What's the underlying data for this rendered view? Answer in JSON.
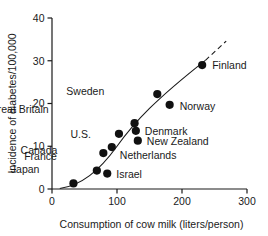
{
  "chart_data": {
    "type": "scatter",
    "title": "",
    "xlabel": "Consumption of cow  milk (liters/person)",
    "ylabel": "Incidence of diabetes/100,000",
    "xlim": [
      0,
      300
    ],
    "ylim": [
      0,
      40
    ],
    "xticks": [
      "0",
      "100",
      "200",
      "300"
    ],
    "xtick_values": [
      0,
      100,
      200,
      300
    ],
    "yticks": [
      "0",
      "10",
      "20",
      "30",
      "40"
    ],
    "ytick_values": [
      0,
      10,
      20,
      30,
      40
    ],
    "grid": false,
    "legend": "none",
    "annotations": [
      "Fitted trend curve rising through the points, extended with a dashed segment beyond Finland"
    ],
    "points": [
      {
        "label": "Japan",
        "x": 33,
        "y": 1.3,
        "label_dx": -34,
        "label_dy": -10
      },
      {
        "label": "France",
        "x": 69,
        "y": 4.3,
        "label_dx": -40,
        "label_dy": -11
      },
      {
        "label": "Israel",
        "x": 85,
        "y": 3.6,
        "label_dx": 9,
        "label_dy": 4
      },
      {
        "label": "Canada",
        "x": 79,
        "y": 8.4,
        "label_dx": -46,
        "label_dy": 1
      },
      {
        "label": "Netherlands",
        "x": 92,
        "y": 9.8,
        "label_dx": 8,
        "label_dy": 12
      },
      {
        "label": "U.S.",
        "x": 103,
        "y": 12.9,
        "label_dx": -28,
        "label_dy": 4
      },
      {
        "label": "Great Britain",
        "x": 127,
        "y": 15.4,
        "label_dx": -86,
        "label_dy": -10
      },
      {
        "label": "Denmark",
        "x": 129,
        "y": 13.6,
        "label_dx": 9,
        "label_dy": 4
      },
      {
        "label": "New Zealand",
        "x": 132,
        "y": 11.3,
        "label_dx": 9,
        "label_dy": 4
      },
      {
        "label": "Sweden",
        "x": 162,
        "y": 22.2,
        "label_dx": -53,
        "label_dy": 1
      },
      {
        "label": "Norway",
        "x": 181,
        "y": 19.7,
        "label_dx": 10,
        "label_dy": 5
      },
      {
        "label": "Finland",
        "x": 231,
        "y": 29.0,
        "label_dx": 10,
        "label_dy": 4
      }
    ]
  }
}
